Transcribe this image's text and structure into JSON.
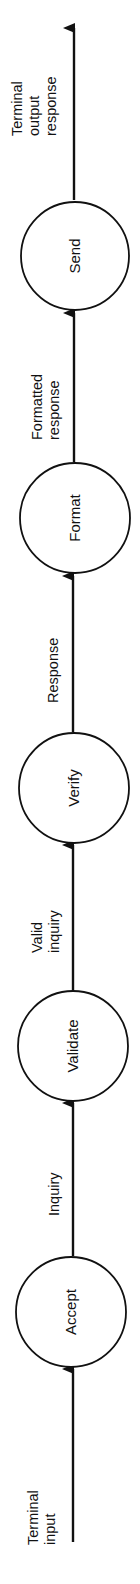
{
  "diagram": {
    "type": "data-flow",
    "orientation": "bottom-to-top",
    "nodes": [
      {
        "id": "accept",
        "label": "Accept"
      },
      {
        "id": "validate",
        "label": "Validate"
      },
      {
        "id": "verify",
        "label": "Verify"
      },
      {
        "id": "format",
        "label": "Format"
      },
      {
        "id": "send",
        "label": "Send"
      }
    ],
    "edges": [
      {
        "from": null,
        "to": "accept",
        "label_lines": [
          "Terminal",
          "input"
        ]
      },
      {
        "from": "accept",
        "to": "validate",
        "label_lines": [
          "Inquiry"
        ]
      },
      {
        "from": "validate",
        "to": "verify",
        "label_lines": [
          "Valid",
          "inquiry"
        ]
      },
      {
        "from": "verify",
        "to": "format",
        "label_lines": [
          "Response"
        ]
      },
      {
        "from": "format",
        "to": "send",
        "label_lines": [
          "Formatted",
          "response"
        ]
      },
      {
        "from": "send",
        "to": null,
        "label_lines": [
          "Terminal",
          "output",
          "response"
        ]
      }
    ]
  },
  "colors": {
    "stroke": "#111111",
    "background": "#ffffff"
  }
}
